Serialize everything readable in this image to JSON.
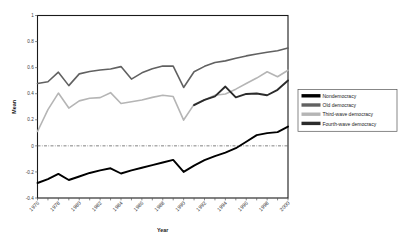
{
  "chart_data": {
    "type": "line",
    "title": "",
    "xlabel": "Year",
    "ylabel": "Mean",
    "xlim": [
      1976,
      2000
    ],
    "ylim": [
      -0.4,
      1
    ],
    "yticks": [
      -0.4,
      -0.2,
      0,
      0.2,
      0.4,
      0.6,
      0.8,
      1
    ],
    "ytick_labels": [
      "-0.4",
      "-0.2",
      "0",
      "0.2",
      "0.4",
      "0.6",
      "0.8",
      "1"
    ],
    "xticks": [
      1976,
      1977,
      1978,
      1979,
      1980,
      1981,
      1982,
      1983,
      1984,
      1985,
      1986,
      1987,
      1988,
      1989,
      1990,
      1991,
      1992,
      1993,
      1994,
      1995,
      1996,
      1997,
      1998,
      1999,
      2000
    ],
    "xtick_labels": [
      "1976",
      "1978",
      "1980",
      "1982",
      "1984",
      "1986",
      "1988",
      "1990",
      "1992",
      "1994",
      "1996",
      "1998",
      "2000"
    ],
    "xtick_label_years": [
      1976,
      1978,
      1980,
      1982,
      1984,
      1986,
      1988,
      1990,
      1992,
      1994,
      1996,
      1998,
      2000
    ],
    "grid": false,
    "zero_reference_line": 0,
    "legend_position": "right",
    "x": [
      1976,
      1977,
      1978,
      1979,
      1980,
      1981,
      1982,
      1983,
      1984,
      1985,
      1986,
      1987,
      1988,
      1989,
      1990,
      1991,
      1992,
      1993,
      1994,
      1995,
      1996,
      1997,
      1998,
      1999,
      2000
    ],
    "series": [
      {
        "name": "Nondemocracy",
        "color": "#000000",
        "width": 1.9,
        "values": [
          -0.285,
          -0.255,
          -0.215,
          -0.262,
          -0.235,
          -0.208,
          -0.188,
          -0.172,
          -0.212,
          -0.188,
          -0.168,
          -0.148,
          -0.128,
          -0.108,
          -0.2,
          -0.152,
          -0.11,
          -0.078,
          -0.052,
          -0.018,
          0.032,
          0.082,
          0.098,
          0.105,
          0.148
        ]
      },
      {
        "name": "Old democracy",
        "color": "#616161",
        "width": 1.6,
        "values": [
          0.478,
          0.492,
          0.565,
          0.462,
          0.552,
          0.57,
          0.582,
          0.59,
          0.608,
          0.512,
          0.56,
          0.592,
          0.612,
          0.612,
          0.448,
          0.568,
          0.61,
          0.64,
          0.652,
          0.672,
          0.69,
          0.705,
          0.718,
          0.73,
          0.75
        ]
      },
      {
        "name": "Third-wave democracy",
        "color": "#b5b5b5",
        "width": 1.6,
        "values": [
          0.11,
          0.278,
          0.405,
          0.29,
          0.345,
          0.365,
          0.37,
          0.408,
          0.325,
          0.338,
          0.352,
          0.372,
          0.388,
          0.378,
          0.198,
          0.318,
          0.352,
          0.388,
          0.398,
          0.435,
          0.478,
          0.52,
          0.568,
          0.53,
          0.58
        ]
      },
      {
        "name": "Fourth-wave democracy",
        "color": "#2b2b2b",
        "width": 1.9,
        "start_year": 1991,
        "values": [
          null,
          null,
          null,
          null,
          null,
          null,
          null,
          null,
          null,
          null,
          null,
          null,
          null,
          null,
          null,
          0.312,
          0.352,
          0.38,
          0.455,
          0.372,
          0.398,
          0.402,
          0.388,
          0.43,
          0.502
        ]
      }
    ]
  },
  "legend": {
    "items": [
      {
        "label": "Nondemocracy",
        "color": "#000000"
      },
      {
        "label": "Old democracy",
        "color": "#616161"
      },
      {
        "label": "Third-wave democracy",
        "color": "#b5b5b5"
      },
      {
        "label": "Fourth-wave democracy",
        "color": "#2b2b2b"
      }
    ]
  }
}
